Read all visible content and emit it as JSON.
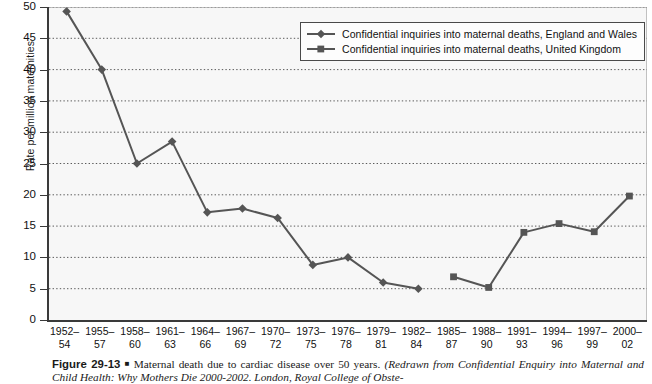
{
  "chart_data": {
    "type": "line",
    "title": "Maternal death due to cardiac disease over 50 years.",
    "xlabel": "",
    "ylabel": "Rate per million maternities",
    "ylim": [
      0,
      50
    ],
    "ytick_step": 5,
    "yticks": [
      0,
      5,
      10,
      15,
      20,
      25,
      30,
      35,
      40,
      45,
      50
    ],
    "grid": "horizontal-dotted",
    "legend_position": "top-right-inside",
    "categories": [
      "1952–54",
      "1955–57",
      "1958–60",
      "1961–63",
      "1964–66",
      "1967–69",
      "1970–72",
      "1973–75",
      "1976–78",
      "1979–81",
      "1982–84",
      "1985–87",
      "1988–90",
      "1991–93",
      "1994–96",
      "1997–99",
      "2000–02"
    ],
    "categories_line1": [
      "1952–",
      "1955–",
      "1958–",
      "1961–",
      "1964–",
      "1967–",
      "1970–",
      "1973–",
      "1976–",
      "1979–",
      "1982–",
      "1985–",
      "1988–",
      "1991–",
      "1994–",
      "1997–",
      "2000–"
    ],
    "categories_line2": [
      "54",
      "57",
      "60",
      "63",
      "66",
      "69",
      "72",
      "75",
      "78",
      "81",
      "84",
      "87",
      "90",
      "93",
      "96",
      "99",
      "02"
    ],
    "series": [
      {
        "name": "Confidential inquiries into maternal deaths, England and Wales",
        "marker": "diamond",
        "color": "#555555",
        "values": [
          49.3,
          40.0,
          25.0,
          28.5,
          17.2,
          17.8,
          16.3,
          8.8,
          10.0,
          6.0,
          5.0,
          null,
          null,
          null,
          null,
          null,
          null
        ]
      },
      {
        "name": "Confidential inquiries into maternal deaths, United Kingdom",
        "marker": "square",
        "color": "#555555",
        "values": [
          null,
          null,
          null,
          null,
          null,
          null,
          null,
          null,
          null,
          null,
          null,
          6.9,
          5.2,
          14.0,
          15.4,
          14.1,
          19.8
        ]
      }
    ]
  },
  "legend": {
    "items": [
      {
        "label": "Confidential inquiries into maternal deaths, England and Wales",
        "marker": "diamond"
      },
      {
        "label": "Confidential inquiries into maternal deaths, United Kingdom",
        "marker": "square"
      }
    ]
  },
  "caption": {
    "figure_number": "Figure 29-13",
    "bullet": "■",
    "line1_roman": "Maternal death due to cardiac disease over 50 years. ",
    "line1_italic": "(Redrawn from Confidential",
    "line2_italic": "Enquiry into Maternal and Child Health: Why Mothers Die 2000-2002. London, Royal College of Obste-"
  }
}
